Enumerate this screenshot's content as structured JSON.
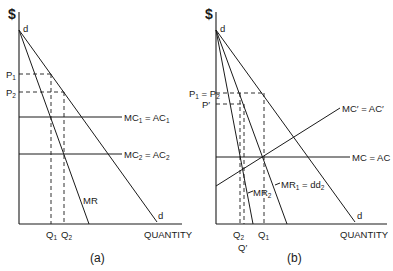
{
  "figure": {
    "panels": [
      {
        "id": "a",
        "caption": "(a)",
        "y_axis_label": "$",
        "x_axis_label": "QUANTITY",
        "apex_label": "d",
        "demand_end_label": "d",
        "price_labels": [
          {
            "main": "P",
            "sub": "1"
          },
          {
            "main": "P",
            "sub": "2"
          }
        ],
        "quantity_labels": [
          {
            "main": "Q",
            "sub": "1"
          },
          {
            "main": "Q",
            "sub": "2"
          }
        ],
        "curves": {
          "mr": "MR",
          "mc1": {
            "a": "MC",
            "a_sub": "1",
            "eq": " = ",
            "b": "AC",
            "b_sub": "1"
          },
          "mc2": {
            "a": "MC",
            "a_sub": "2",
            "eq": " = ",
            "b": "AC",
            "b_sub": "2"
          }
        }
      },
      {
        "id": "b",
        "caption": "(b)",
        "y_axis_label": "$",
        "x_axis_label": "QUANTITY",
        "apex_label": "d",
        "demand_end_label": "d",
        "price_labels": [
          {
            "main": "P",
            "sub": "1",
            "eq": " = ",
            "main2": "P",
            "sub2": "2"
          },
          {
            "main": "P′"
          }
        ],
        "quantity_labels": [
          {
            "main": "Q",
            "sub": "2"
          },
          {
            "main": "Q",
            "sub": "1"
          },
          {
            "main": "Q′"
          }
        ],
        "curves": {
          "mc_prime": {
            "text": "MC′ = AC′"
          },
          "mc": {
            "text": "MC = AC"
          },
          "mr1": {
            "a": "MR",
            "a_sub": "1",
            "eq": " = dd",
            "b_sub": "2"
          },
          "mr2": {
            "a": "MR",
            "a_sub": "2"
          }
        }
      }
    ]
  }
}
